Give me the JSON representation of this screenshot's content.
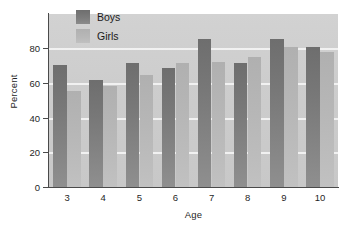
{
  "chart_data": {
    "type": "bar",
    "title": "",
    "subtitle": "",
    "xlabel": "Age",
    "ylabel": "Percent",
    "categories": [
      "3",
      "4",
      "5",
      "6",
      "7",
      "8",
      "9",
      "10"
    ],
    "series": [
      {
        "name": "Boys",
        "color": "#7a7a7a",
        "values": [
          70.5,
          62,
          71.5,
          69,
          85.5,
          71.5,
          85.5,
          81
        ]
      },
      {
        "name": "Girls",
        "color": "#b8b8b8",
        "values": [
          55.5,
          58.5,
          64.5,
          71.5,
          72.5,
          75,
          81,
          78
        ]
      }
    ],
    "ylim": [
      0,
      100
    ],
    "yticks": [
      0,
      20,
      40,
      60,
      80
    ],
    "ytick_labels": [
      "0",
      "20",
      "40",
      "60",
      "80"
    ],
    "grid": "horizontal-only",
    "gridline_color": "#f4f4f4",
    "legend_position": "top-left-inside",
    "plot_background": "#cdcdcd",
    "figure_background": "#ffffff",
    "axis_color": "#4a4a4a"
  },
  "legend": {
    "entries": [
      {
        "label": "Boys"
      },
      {
        "label": "Girls"
      }
    ]
  }
}
